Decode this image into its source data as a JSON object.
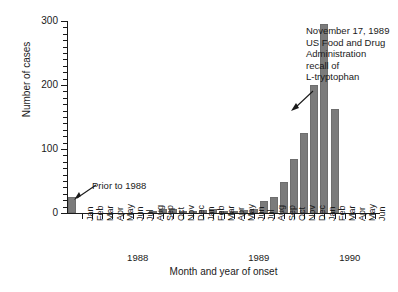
{
  "chart_data": {
    "type": "bar",
    "title": "",
    "xlabel": "Month and year of onset",
    "ylabel": "Number of cases",
    "ylim": [
      0,
      300
    ],
    "y_ticks": [
      0,
      100,
      200,
      300
    ],
    "y_minor_tick_step": 10,
    "grid": false,
    "legend": "none",
    "bar_color": "#7b7b7b",
    "categories": [
      "Prior to 1988",
      "Jan",
      "Feb",
      "Mar",
      "Apr",
      "May",
      "Jun",
      "Jul",
      "Aug",
      "Sep",
      "Oct",
      "Nov",
      "Dec",
      "Jan",
      "Feb",
      "Mar",
      "Apr",
      "May",
      "Jun",
      "Jul",
      "Aug",
      "Sep",
      "Oct",
      "Nov",
      "Dec",
      "Jan",
      "Feb",
      "Mar",
      "Apr",
      "May",
      "Jun"
    ],
    "year_groups": [
      {
        "label": "1988",
        "start_index": 1,
        "end_index": 12
      },
      {
        "label": "1989",
        "start_index": 13,
        "end_index": 24
      },
      {
        "label": "1990",
        "start_index": 25,
        "end_index": 30
      }
    ],
    "values": [
      25,
      0,
      0,
      0,
      0,
      0,
      0,
      0,
      3,
      6,
      6,
      2,
      3,
      4,
      6,
      3,
      2,
      5,
      7,
      18,
      25,
      48,
      85,
      125,
      200,
      295,
      163,
      0,
      0,
      0,
      0
    ],
    "series": [
      {
        "name": "Cases of eosinophilia-myalgia syndrome",
        "values": [
          25,
          0,
          0,
          0,
          0,
          0,
          0,
          0,
          3,
          6,
          6,
          2,
          3,
          4,
          6,
          3,
          2,
          5,
          7,
          18,
          25,
          48,
          85,
          125,
          200,
          295,
          163,
          0,
          0,
          0,
          0
        ]
      }
    ],
    "annotations": [
      {
        "name": "prior-to-1988",
        "text": "Prior to 1988",
        "points_to_category": "Prior to 1988"
      },
      {
        "name": "fda-recall",
        "text": "November 17, 1989\nUS Food and Drug\nAdministration\nrecall of\nL-tryptophan",
        "points_to_category": "Nov 1989"
      }
    ]
  },
  "axes": {
    "y_title": "Number of cases",
    "x_title": "Month and year of onset",
    "y_labels": [
      "300",
      "200",
      "100",
      "0"
    ],
    "year_labels": [
      "1988",
      "1989",
      "1990"
    ]
  },
  "annotations": {
    "prior_to_1988": "Prior to 1988",
    "fda_recall": "November 17, 1989\nUS Food and Drug\nAdministration\nrecall of\nL-tryptophan"
  }
}
